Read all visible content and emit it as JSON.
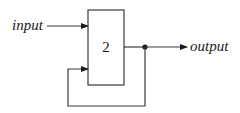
{
  "diagram": {
    "type": "block-diagram-feedback",
    "input_label": "input",
    "output_label": "output",
    "block_label": "2",
    "colors": {
      "line": "#3a3a3a",
      "text": "#1a1a1a",
      "background": "#ffffff"
    },
    "nodes": [
      {
        "id": "input",
        "label": "input"
      },
      {
        "id": "block",
        "label": "2"
      },
      {
        "id": "junction",
        "label": ""
      },
      {
        "id": "output",
        "label": "output"
      }
    ],
    "edges": [
      {
        "from": "input",
        "to": "block"
      },
      {
        "from": "block",
        "to": "junction"
      },
      {
        "from": "junction",
        "to": "output"
      },
      {
        "from": "junction",
        "to": "block",
        "kind": "feedback"
      }
    ]
  }
}
